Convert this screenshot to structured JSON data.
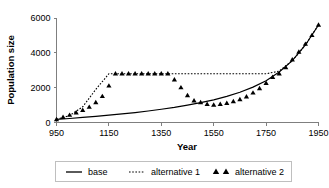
{
  "chart_data": {
    "type": "line",
    "title": "",
    "xlabel": "Year",
    "ylabel": "Population size",
    "xlim": [
      950,
      1950
    ],
    "ylim": [
      0,
      6000
    ],
    "xticks": [
      950,
      1150,
      1350,
      1550,
      1750,
      1950
    ],
    "xtick_labels": [
      "950",
      "1150",
      "1350",
      "1550",
      "1750",
      "1950"
    ],
    "yticks": [
      0,
      2000,
      4000,
      6000
    ],
    "ytick_labels": [
      "0",
      "2000",
      "4000",
      "6000"
    ],
    "grid": false,
    "legend_position": "below",
    "series": [
      {
        "name": "base",
        "style": "solid-line",
        "color": "#000000",
        "x": [
          950,
          1000,
          1050,
          1100,
          1150,
          1200,
          1250,
          1300,
          1350,
          1400,
          1450,
          1500,
          1550,
          1600,
          1650,
          1700,
          1750,
          1800,
          1850,
          1900,
          1950
        ],
        "values": [
          180,
          230,
          290,
          350,
          420,
          490,
          570,
          660,
          760,
          870,
          1000,
          1140,
          1300,
          1500,
          1740,
          2030,
          2400,
          2900,
          3550,
          4450,
          5600
        ]
      },
      {
        "name": "alternative 1",
        "style": "dotted-line",
        "color": "#000000",
        "x": [
          950,
          1000,
          1050,
          1100,
          1150,
          1200,
          1250,
          1300,
          1350,
          1400,
          1450,
          1500,
          1550,
          1600,
          1650,
          1700,
          1750,
          1800,
          1850,
          1900,
          1950
        ],
        "values": [
          180,
          400,
          900,
          1900,
          2800,
          2800,
          2800,
          2800,
          2800,
          2800,
          2800,
          2800,
          2800,
          2800,
          2800,
          2800,
          2800,
          2950,
          3550,
          4450,
          5600
        ]
      },
      {
        "name": "alternative 2",
        "style": "triangle-markers",
        "color": "#000000",
        "x": [
          950,
          975,
          1000,
          1025,
          1050,
          1075,
          1100,
          1125,
          1150,
          1175,
          1200,
          1225,
          1250,
          1275,
          1300,
          1325,
          1350,
          1375,
          1400,
          1425,
          1450,
          1475,
          1500,
          1525,
          1550,
          1575,
          1600,
          1625,
          1650,
          1675,
          1700,
          1725,
          1750,
          1775,
          1800,
          1825,
          1850,
          1875,
          1900,
          1925,
          1950
        ],
        "values": [
          170,
          300,
          420,
          560,
          700,
          880,
          1150,
          1500,
          2100,
          2800,
          2800,
          2800,
          2800,
          2800,
          2800,
          2800,
          2800,
          2800,
          2450,
          2000,
          1550,
          1250,
          1150,
          1050,
          1000,
          1050,
          1100,
          1200,
          1320,
          1480,
          1700,
          1950,
          2250,
          2600,
          2800,
          3150,
          3600,
          4050,
          4500,
          5000,
          5600
        ]
      }
    ]
  },
  "legend": {
    "items": [
      {
        "label": "base",
        "marker": "solid-line"
      },
      {
        "label": "alternative 1",
        "marker": "dotted-line"
      },
      {
        "label": "alternative 2",
        "marker": "triangle-markers"
      }
    ]
  }
}
